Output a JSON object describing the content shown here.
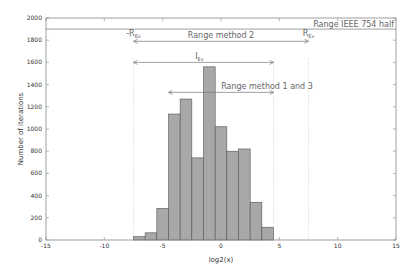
{
  "chart_data": {
    "type": "bar",
    "title": "",
    "xlabel": "log2(x)",
    "ylabel": "Number of iterations",
    "xlim": [
      -15,
      15
    ],
    "ylim": [
      0,
      2000
    ],
    "x_ticks": [
      -15,
      -10,
      -5,
      0,
      5,
      10,
      15
    ],
    "y_ticks": [
      0,
      200,
      400,
      600,
      800,
      1000,
      1200,
      1400,
      1600,
      1800,
      2000
    ],
    "grid": false,
    "bin_width": 1,
    "bin_edges": [
      -7.5,
      -6.5,
      -5.5,
      -4.5,
      -3.5,
      -2.5,
      -1.5,
      -0.5,
      0.5,
      1.5,
      2.5,
      3.5,
      4.5
    ],
    "values": [
      30,
      65,
      285,
      1135,
      1270,
      740,
      1560,
      1020,
      800,
      820,
      340,
      115
    ],
    "bar_color": "#a8a8a8",
    "bar_edge_color": "#555555",
    "annotations": [
      {
        "id": "ieee",
        "label": "Range IEEE 754 half",
        "from": -15,
        "to": 15,
        "y": 1900
      },
      {
        "id": "method2",
        "label": "Range method 2",
        "from": -7.5,
        "to": 7.5,
        "y": 1790
      },
      {
        "id": "iev",
        "label": "I",
        "sub": "Ev",
        "from": -7.5,
        "to": 4.5,
        "y": 1600
      },
      {
        "id": "method13",
        "label": "Range method 1 and 3",
        "from": -4.5,
        "to": 4.5,
        "y": 1330
      },
      {
        "id": "neg_rev",
        "label": "-R",
        "sub": "Ev",
        "x": -7.5
      },
      {
        "id": "rev",
        "label": "R",
        "sub": "Ev",
        "x": 7.5
      }
    ],
    "vlines": [
      -7.5,
      4.5,
      7.5
    ]
  }
}
